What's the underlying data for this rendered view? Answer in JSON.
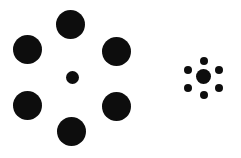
{
  "figure": {
    "background_color": "#ffffff",
    "dot_color": "#0d0d0d",
    "width": 241,
    "height": 158
  },
  "chart_data": {
    "type": "scatter",
    "subtitle": "Two identical-appearing central discs surrounded by large vs. small inducer discs",
    "xlabel": "",
    "ylabel": "",
    "xlim": [
      0,
      241
    ],
    "ylim": [
      0,
      158
    ],
    "grid": false,
    "legend": null,
    "units": "pixels",
    "series": [
      {
        "name": "left-cluster-center",
        "role": "target",
        "marker": "filled-circle",
        "color": "#0d0d0d",
        "points": [
          {
            "id": "L-center",
            "x": 72,
            "y": 77,
            "diameter": 13,
            "radius": 6.5
          }
        ]
      },
      {
        "name": "left-cluster-inducers",
        "role": "surround-large",
        "marker": "filled-circle",
        "color": "#0d0d0d",
        "count": 6,
        "points": [
          {
            "id": "L-top",
            "x": 70,
            "y": 24,
            "diameter": 29,
            "radius": 14.5
          },
          {
            "id": "L-upper-left",
            "x": 27,
            "y": 49,
            "diameter": 29,
            "radius": 14.5
          },
          {
            "id": "L-upper-right",
            "x": 116,
            "y": 51,
            "diameter": 29,
            "radius": 14.5
          },
          {
            "id": "L-lower-left",
            "x": 27,
            "y": 105,
            "diameter": 29,
            "radius": 14.5
          },
          {
            "id": "L-lower-right",
            "x": 116,
            "y": 106,
            "diameter": 29,
            "radius": 14.5
          },
          {
            "id": "L-bottom",
            "x": 71,
            "y": 131,
            "diameter": 29,
            "radius": 14.5
          }
        ]
      },
      {
        "name": "right-cluster-center",
        "role": "target",
        "marker": "filled-circle",
        "color": "#0d0d0d",
        "points": [
          {
            "id": "R-center",
            "x": 203,
            "y": 76,
            "diameter": 15,
            "radius": 7.5
          }
        ]
      },
      {
        "name": "right-cluster-inducers",
        "role": "surround-small",
        "marker": "filled-circle",
        "color": "#0d0d0d",
        "count": 6,
        "points": [
          {
            "id": "R-top",
            "x": 204,
            "y": 61,
            "diameter": 8,
            "radius": 4
          },
          {
            "id": "R-upper-left",
            "x": 188,
            "y": 70,
            "diameter": 8,
            "radius": 4
          },
          {
            "id": "R-upper-right",
            "x": 219,
            "y": 70,
            "diameter": 8,
            "radius": 4
          },
          {
            "id": "R-lower-left",
            "x": 188,
            "y": 88,
            "diameter": 8,
            "radius": 4
          },
          {
            "id": "R-lower-right",
            "x": 219,
            "y": 88,
            "diameter": 8,
            "radius": 4
          },
          {
            "id": "R-bottom",
            "x": 204,
            "y": 95,
            "diameter": 8,
            "radius": 4
          }
        ]
      }
    ]
  }
}
